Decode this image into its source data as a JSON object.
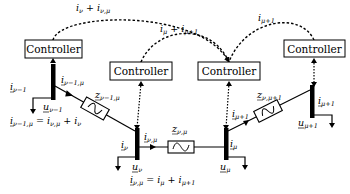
{
  "controllers": [
    {
      "id": "c1",
      "label": "Controller"
    },
    {
      "id": "c2",
      "label": "Controller"
    },
    {
      "id": "c3",
      "label": "Controller"
    },
    {
      "id": "c4",
      "label": "Controller"
    }
  ],
  "comm_links": [
    {
      "from": "c1",
      "to": "c3",
      "label": "i_ν + i_ν,μ",
      "main": "i",
      "sub": "ν",
      "plus": " + ",
      "main2": "i",
      "sub2": "ν,μ"
    },
    {
      "from": "c2",
      "to": "c3",
      "label": "i_μ + i_μ+1",
      "main": "i",
      "sub": "μ",
      "plus": " + ",
      "main2": "i",
      "sub2": "μ+1"
    },
    {
      "from": "c4",
      "to": "c3",
      "label": "i_μ+1",
      "main": "i",
      "sub": "μ+1"
    }
  ],
  "buses": [
    {
      "id": "bus-nu-minus-1",
      "voltage": {
        "main": "u",
        "sub": "ν−1"
      },
      "injection": {
        "main": "i",
        "sub": "ν−1"
      }
    },
    {
      "id": "bus-nu",
      "voltage": {
        "main": "u",
        "sub": "ν"
      },
      "injection": {
        "main": "i",
        "sub": "ν"
      }
    },
    {
      "id": "bus-mu",
      "voltage": {
        "main": "u",
        "sub": "μ"
      },
      "injection": {
        "main": "i",
        "sub": "μ"
      }
    },
    {
      "id": "bus-mu-plus-1",
      "voltage": {
        "main": "u",
        "sub": "μ+1"
      },
      "injection": {
        "main": "i",
        "sub": "μ+1"
      }
    }
  ],
  "lines": [
    {
      "id": "line-1",
      "impedance": {
        "main": "z",
        "sub": "ν−1,μ"
      },
      "current": {
        "main": "i",
        "sub": "ν−1,μ"
      }
    },
    {
      "id": "line-2",
      "impedance": {
        "main": "z",
        "sub": "ν,μ"
      },
      "current": {
        "main": "i",
        "sub": "ν,μ"
      }
    },
    {
      "id": "line-3",
      "impedance": {
        "main": "z",
        "sub": "ν,μ+1"
      },
      "current": {
        "main": "i",
        "sub": "μ+1"
      }
    }
  ],
  "equations": [
    {
      "id": "eq1",
      "lhs_main": "i",
      "lhs_sub": "ν−1,μ",
      "eq": " = ",
      "t1_main": "i",
      "t1_sub": "ν,μ",
      "op": " + ",
      "t2_main": "i",
      "t2_sub": "ν"
    },
    {
      "id": "eq2",
      "lhs_main": "i",
      "lhs_sub": "ν,μ",
      "eq": " = ",
      "t1_main": "i",
      "t1_sub": "μ",
      "op": " + ",
      "t2_main": "i",
      "t2_sub": "μ+1"
    }
  ]
}
